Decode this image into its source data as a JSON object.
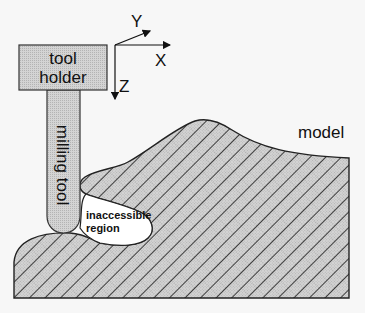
{
  "figure": {
    "colors": {
      "background": "#f7f7f7",
      "fill_gray": "#c8c8c8",
      "outline": "#222222",
      "hatch": "#1a1a1a",
      "cavity": "#ffffff"
    }
  },
  "labels": {
    "tool_holder_line1": "tool",
    "tool_holder_line2": "holder",
    "milling_tool": "milling tool",
    "model": "model",
    "inaccessible_line1": "inaccessible",
    "inaccessible_line2": "region"
  },
  "axes": {
    "x_label": "X",
    "y_label": "Y",
    "z_label": "Z"
  }
}
